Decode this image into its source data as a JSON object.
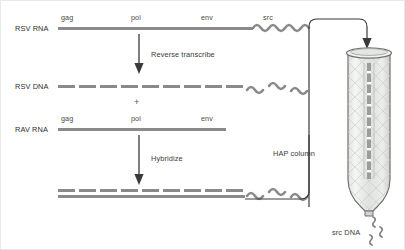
{
  "figure": {
    "background_color": "#ffffff",
    "strand_color": "#8a8a8a",
    "ink_color": "#3a3a3a",
    "glass_color": "#d8dad8"
  },
  "rows": [
    {
      "id": "rsv-rna",
      "name": "RSV RNA",
      "strand_style": "solid",
      "genes": [
        "gag",
        "pol",
        "env"
      ],
      "tail": "src",
      "tail_style": "squiggle-continuous"
    },
    {
      "id": "rsv-dna",
      "name": "RSV DNA",
      "strand_style": "dashed",
      "genes": [],
      "tail": "",
      "tail_style": "squiggle-broken"
    },
    {
      "id": "rav-rna",
      "name": "RAV RNA",
      "strand_style": "solid",
      "genes": [
        "gag",
        "pol",
        "env"
      ],
      "tail": "",
      "tail_style": "none"
    },
    {
      "id": "hybrid-duplex",
      "name": "",
      "strand_style": "duplex",
      "genes": [],
      "tail": "",
      "tail_style": "squiggle-broken"
    }
  ],
  "steps": [
    {
      "id": "reverse-transcribe",
      "label": "Reverse transcribe"
    },
    {
      "id": "hybridize",
      "label": "Hybridize"
    }
  ],
  "apparatus": {
    "pipe_label": "HAP column",
    "column_name": "HAP column",
    "output_label": "src DNA"
  },
  "plus_symbol": "+"
}
